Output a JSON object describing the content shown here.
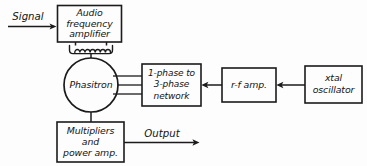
{
  "diagram": {
    "background_color": "#fdfdfd",
    "ink_color": "#1b1b1b",
    "blocks": [
      {
        "id": "audio-frequency-amplifier",
        "shape": "rect",
        "lines": [
          "Audio",
          "frequency",
          "amplifier"
        ]
      },
      {
        "id": "phasitron",
        "shape": "circle",
        "lines": [
          "Phasitron"
        ]
      },
      {
        "id": "one-phase-to-three-phase-network",
        "shape": "rect",
        "lines": [
          "1-phase to",
          "3-phase",
          "network"
        ]
      },
      {
        "id": "rf-amplifier",
        "shape": "rect",
        "lines": [
          "r-f amp."
        ]
      },
      {
        "id": "xtal-oscillator",
        "shape": "rect",
        "lines": [
          "xtal",
          "oscillator"
        ]
      },
      {
        "id": "multipliers-and-power-amplifier",
        "shape": "rect",
        "lines": [
          "Multipliers",
          "and",
          "power amp."
        ]
      }
    ],
    "labels": {
      "signal": "Signal",
      "output": "Output"
    },
    "connections": [
      {
        "from": "signal-input",
        "to": "audio-frequency-amplifier",
        "arrow": true
      },
      {
        "from": "audio-frequency-amplifier",
        "to": "phasitron",
        "arrow": false,
        "element": "coil"
      },
      {
        "from": "phasitron",
        "to": "one-phase-to-three-phase-network",
        "arrow": false,
        "lines": 3
      },
      {
        "from": "rf-amplifier",
        "to": "one-phase-to-three-phase-network",
        "arrow": true
      },
      {
        "from": "xtal-oscillator",
        "to": "rf-amplifier",
        "arrow": true
      },
      {
        "from": "phasitron",
        "to": "multipliers-and-power-amplifier",
        "arrow": false
      },
      {
        "from": "multipliers-and-power-amplifier",
        "to": "output",
        "arrow": true
      }
    ]
  }
}
